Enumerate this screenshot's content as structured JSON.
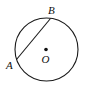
{
  "diagram": {
    "type": "circle-with-chord",
    "circle": {
      "center_label": "O"
    },
    "points": [
      {
        "label": "A"
      },
      {
        "label": "B"
      }
    ],
    "colors": {
      "stroke": "#1a1a1a",
      "background": "#ffffff"
    }
  }
}
